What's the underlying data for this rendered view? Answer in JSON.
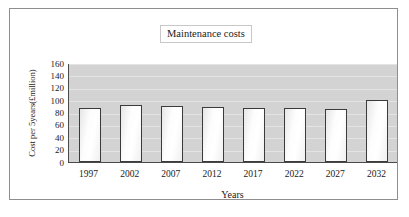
{
  "chart_data": {
    "type": "bar",
    "title": "Maintenance costs",
    "xlabel": "Years",
    "ylabel": "Cost per 5years(£million)",
    "categories": [
      "1997",
      "2002",
      "2007",
      "2012",
      "2017",
      "2022",
      "2027",
      "2032"
    ],
    "values": [
      88,
      92,
      91,
      89,
      88,
      87,
      86,
      101
    ],
    "ylim": [
      0,
      160
    ],
    "ytick_step": 20,
    "yticks": [
      "160",
      "140",
      "120",
      "100",
      "80",
      "60",
      "40",
      "20",
      "0"
    ],
    "grid": true,
    "legend": "none",
    "series": [
      {
        "name": "Maintenance costs",
        "values": [
          88,
          92,
          91,
          89,
          88,
          87,
          86,
          101
        ]
      }
    ],
    "colors": {
      "plot_background": "#d3d3d3",
      "gridline": "#e4e4e4",
      "bar_border": "#3b3b3b",
      "bar_fill": "#fdfdfd",
      "axis": "#4a4a4a",
      "frame_border": "#8e8e8e",
      "text": "#1a1a1a"
    }
  }
}
